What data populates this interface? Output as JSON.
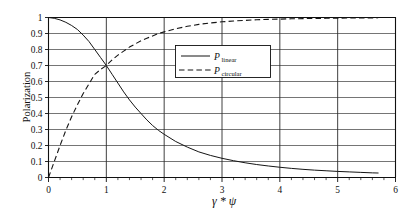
{
  "chart_data": {
    "type": "line",
    "title": "",
    "xlabel": "γ * ψ",
    "ylabel": "Polarization",
    "xlim": [
      0,
      6
    ],
    "ylim": [
      0,
      1
    ],
    "grid": true,
    "legend_position": "upper-center",
    "x_ticks": [
      "0",
      "1",
      "2",
      "3",
      "4",
      "5",
      "6"
    ],
    "x_tick_values": [
      0,
      1,
      2,
      3,
      4,
      5,
      6
    ],
    "x_minor_step": 0.2,
    "y_ticks": [
      "0",
      "0.1",
      "0.2",
      "0.3",
      "0.4",
      "0.5",
      "0.6",
      "0.7",
      "0.8",
      "0.9",
      "1"
    ],
    "y_tick_values": [
      0,
      0.1,
      0.2,
      0.3,
      0.4,
      0.5,
      0.6,
      0.7,
      0.8,
      0.9,
      1
    ],
    "x": [
      0,
      0.1,
      0.2,
      0.3,
      0.4,
      0.5,
      0.6,
      0.7,
      0.8,
      0.9,
      1.0,
      1.1,
      1.2,
      1.3,
      1.4,
      1.5,
      1.6,
      1.7,
      1.8,
      1.9,
      2.0,
      2.2,
      2.4,
      2.6,
      2.8,
      3.0,
      3.2,
      3.4,
      3.6,
      3.8,
      4.0,
      4.2,
      4.4,
      4.6,
      4.8,
      5.0,
      5.2,
      5.4,
      5.6,
      5.7
    ],
    "series": [
      {
        "name": "P_linear",
        "label": "P",
        "sublabel": "linear",
        "style": "solid",
        "values": [
          1.0,
          0.995,
          0.985,
          0.97,
          0.95,
          0.925,
          0.89,
          0.85,
          0.8,
          0.75,
          0.7,
          0.645,
          0.59,
          0.535,
          0.485,
          0.44,
          0.4,
          0.36,
          0.325,
          0.295,
          0.27,
          0.225,
          0.19,
          0.16,
          0.138,
          0.12,
          0.105,
          0.092,
          0.081,
          0.072,
          0.064,
          0.057,
          0.051,
          0.046,
          0.042,
          0.038,
          0.035,
          0.032,
          0.029,
          0.028
        ]
      },
      {
        "name": "P_circular",
        "label": "P",
        "sublabel": "circular",
        "style": "dashed",
        "values": [
          0.0,
          0.1,
          0.2,
          0.295,
          0.38,
          0.455,
          0.525,
          0.585,
          0.645,
          0.675,
          0.7,
          0.735,
          0.765,
          0.79,
          0.815,
          0.835,
          0.855,
          0.87,
          0.885,
          0.9,
          0.91,
          0.93,
          0.945,
          0.957,
          0.966,
          0.973,
          0.978,
          0.982,
          0.986,
          0.988,
          0.99,
          0.992,
          0.993,
          0.994,
          0.995,
          0.996,
          0.9965,
          0.997,
          0.9975,
          0.998
        ]
      }
    ],
    "annotations": {
      "crossing_point": "x ≈ 1.0, y ≈ 0.70"
    }
  },
  "legend": {
    "entries": [
      {
        "label": "P",
        "sublabel": "linear",
        "style": "solid"
      },
      {
        "label": "P",
        "sublabel": "circular",
        "style": "dashed"
      }
    ]
  },
  "axes": {
    "y_title": "Polarization",
    "x_title": "γ * ψ"
  }
}
